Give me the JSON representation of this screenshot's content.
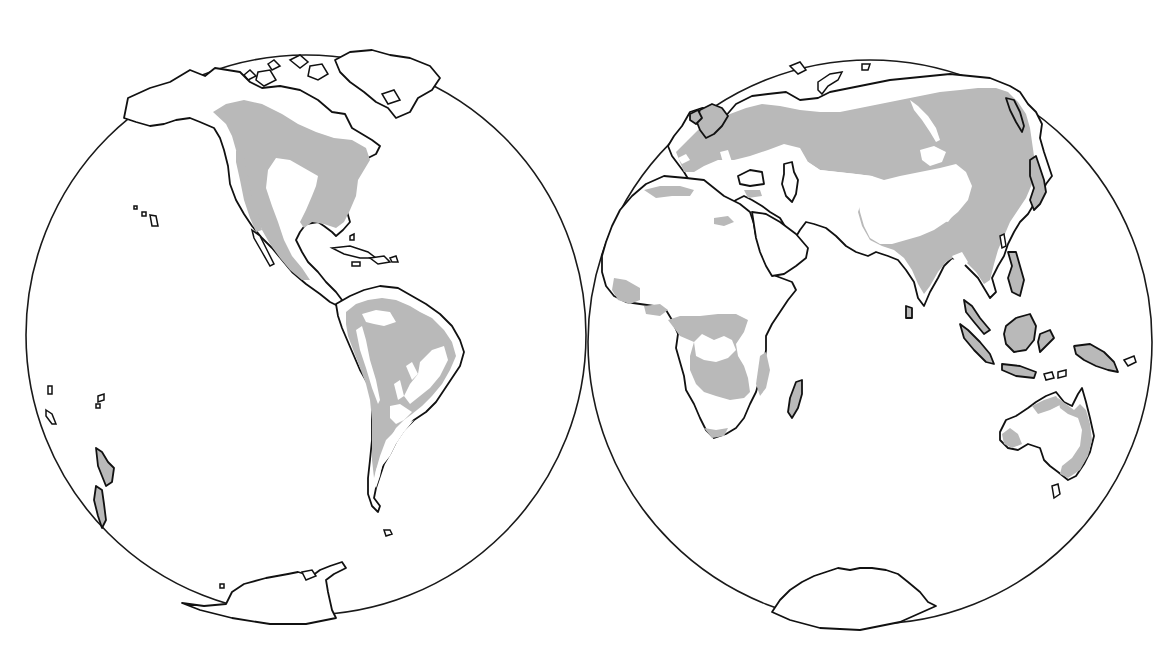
{
  "figure": {
    "type": "dual-hemisphere world outline map",
    "background_color": "#ffffff",
    "outline_color": "#111111",
    "shaded_region_color": "#b9b9b9",
    "unshaded_land_color": "#ffffff",
    "text_labels": []
  },
  "hemispheres": [
    {
      "id": "western",
      "circle": {
        "cx": 306,
        "cy": 335,
        "r": 280
      },
      "regions": [
        {
          "name": "North America",
          "shaded": "partial"
        },
        {
          "name": "Greenland",
          "shaded": "none"
        },
        {
          "name": "Central America",
          "shaded": "partial"
        },
        {
          "name": "Caribbean Islands",
          "shaded": "none"
        },
        {
          "name": "South America",
          "shaded": "partial"
        },
        {
          "name": "New Zealand",
          "shaded": "full"
        },
        {
          "name": "Hawaii",
          "shaded": "none"
        },
        {
          "name": "Antarctica (western)",
          "shaded": "none"
        }
      ]
    },
    {
      "id": "eastern",
      "circle": {
        "cx": 870,
        "cy": 342,
        "r": 282
      },
      "regions": [
        {
          "name": "Europe",
          "shaded": "partial"
        },
        {
          "name": "Asia",
          "shaded": "partial"
        },
        {
          "name": "Africa",
          "shaded": "partial"
        },
        {
          "name": "Madagascar",
          "shaded": "full"
        },
        {
          "name": "Arabian Peninsula",
          "shaded": "none"
        },
        {
          "name": "India",
          "shaded": "full"
        },
        {
          "name": "Southeast Asia / Indonesia",
          "shaded": "partial"
        },
        {
          "name": "Japan",
          "shaded": "partial"
        },
        {
          "name": "Australia",
          "shaded": "partial"
        },
        {
          "name": "Tasmania",
          "shaded": "none"
        },
        {
          "name": "Antarctica (eastern)",
          "shaded": "none"
        }
      ]
    }
  ]
}
